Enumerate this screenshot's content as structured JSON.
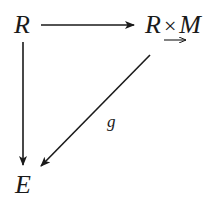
{
  "diagram": {
    "type": "commutative-diagram",
    "nodes": {
      "top_left": {
        "label": "R"
      },
      "top_right": {
        "left": "R",
        "op": "×",
        "right": "M"
      },
      "bottom_left": {
        "label": "E"
      }
    },
    "arrows": [
      {
        "from": "top_left",
        "to": "top_right",
        "label": ""
      },
      {
        "from": "top_left",
        "to": "bottom_left",
        "label": ""
      },
      {
        "from": "top_right",
        "to": "bottom_left",
        "label": "g"
      }
    ],
    "annotations": {
      "under_top_right": "leftward-arrow"
    },
    "edge_labels": {
      "diagonal": "g"
    },
    "colors": {
      "ink": "#1a1a1a",
      "background": "#ffffff"
    }
  }
}
